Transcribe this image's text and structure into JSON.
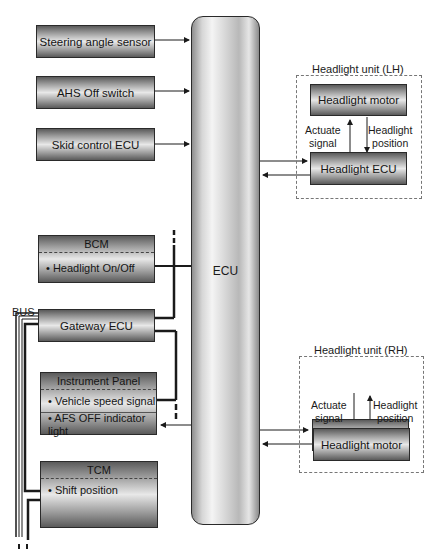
{
  "inputs": [
    {
      "label": "Steering angle sensor"
    },
    {
      "label": "AHS Off switch"
    },
    {
      "label": "Skid control ECU"
    }
  ],
  "bcm": {
    "title": "BCM",
    "items": [
      "• Headlight On/Off"
    ]
  },
  "bus_label": "BUS",
  "gateway": {
    "label": "Gateway ECU"
  },
  "instrument_panel": {
    "title": "Instrument Panel",
    "items": [
      "• Vehicle speed signal",
      "• AFS OFF indicator light"
    ]
  },
  "tcm": {
    "title": "TCM",
    "items": [
      "• Shift position"
    ]
  },
  "ecu": {
    "label": "ECU"
  },
  "headlight_lh": {
    "title": "Headlight unit (LH)",
    "motor": "Headlight motor",
    "ecu": "Headlight ECU",
    "actuate_signal": "Actuate\nsignal",
    "headlight_position": "Headlight\nposition"
  },
  "headlight_rh": {
    "title": "Headlight unit (RH)",
    "motor": "Headlight motor",
    "ecu": "Headlight ECU",
    "actuate_signal": "Actuate\nsignal",
    "headlight_position": "Headlight\nposition"
  },
  "colors": {
    "line": "#1a1a1a",
    "block_dark": "#5a5a5a",
    "block_light": "#e8e8e8",
    "dash": "#777777"
  }
}
